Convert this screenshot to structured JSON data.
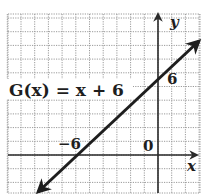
{
  "chart_data": {
    "type": "line",
    "title": "",
    "function_label": "G(x) = x + 6",
    "equation": {
      "slope": 1,
      "intercept": 6
    },
    "xlabel": "x",
    "ylabel": "y",
    "annotations": [
      {
        "text": "6",
        "meaning": "y-intercept tick label",
        "x": 0,
        "y": 6
      },
      {
        "text": "-6",
        "meaning": "x-intercept tick label",
        "x": -6,
        "y": 0
      },
      {
        "text": "0",
        "meaning": "origin label",
        "x": 0,
        "y": 0
      }
    ],
    "series": [
      {
        "name": "G(x) = x + 6",
        "x": [
          -9,
          3
        ],
        "y": [
          -3,
          9
        ],
        "arrows_both_ends": true
      }
    ],
    "xlim": [
      -11,
      3
    ],
    "ylim": [
      -3,
      10
    ],
    "grid": true,
    "grid_step": 1,
    "legend": "none"
  },
  "labels": {
    "function": "G(x) = x + 6",
    "x_axis": "x",
    "y_axis": "y",
    "y_tick": "6",
    "x_tick": "−6",
    "origin": "0"
  },
  "colors": {
    "line": "#1e1e1e",
    "grid": "#9a9a9a",
    "axis": "#2a2a2a",
    "background": "#ffffff"
  }
}
